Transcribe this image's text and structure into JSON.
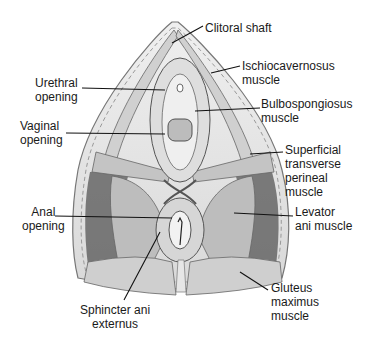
{
  "diagram": {
    "labels": [
      {
        "id": "clitoral-shaft",
        "text": "Clitoral shaft",
        "x": 205,
        "y": 21
      },
      {
        "id": "ischiocavernosus",
        "text": "Ischiocavernosus\nmuscle",
        "x": 242,
        "y": 59
      },
      {
        "id": "urethral-opening",
        "text": "Urethral\nopening",
        "x": 35,
        "y": 76
      },
      {
        "id": "bulbospongiosus",
        "text": "Bulbospongiosus\nmuscle",
        "x": 261,
        "y": 97
      },
      {
        "id": "vaginal-opening",
        "text": "Vaginal\nopening",
        "x": 20,
        "y": 119
      },
      {
        "id": "superficial-transverse",
        "text": "Superficial\ntransverse\nperineal\nmuscle",
        "x": 285,
        "y": 143
      },
      {
        "id": "anal-opening",
        "text": "Anal\nopening",
        "x": 24,
        "y": 205
      },
      {
        "id": "levator-ani",
        "text": "Levator\nani muscle",
        "x": 295,
        "y": 205
      },
      {
        "id": "gluteus-maximus",
        "text": "Gluteus\nmaximus\nmuscle",
        "x": 271,
        "y": 281
      },
      {
        "id": "sphincter-ani",
        "text": "Sphincter ani\nexternus",
        "x": 80,
        "y": 303
      }
    ]
  }
}
